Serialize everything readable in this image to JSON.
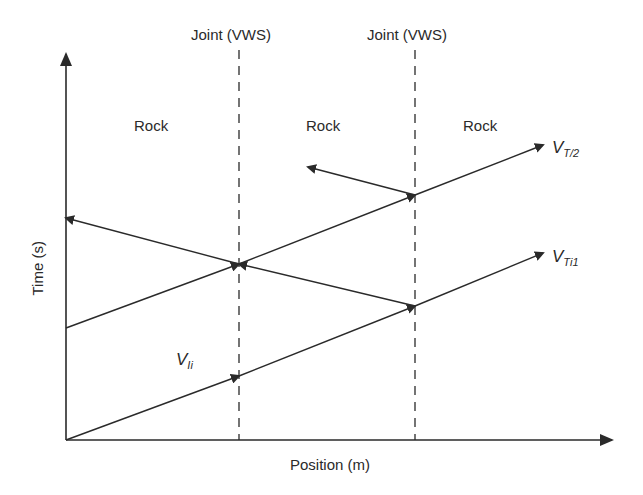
{
  "diagram": {
    "type": "wave-propagation-time-position",
    "axes": {
      "x_label": "Position (m)",
      "y_label": "Time (s)"
    },
    "joints": [
      {
        "label": "Joint (VWS)",
        "x": 239
      },
      {
        "label": "Joint (VWS)",
        "x": 415
      }
    ],
    "regions": [
      {
        "label": "Rock"
      },
      {
        "label": "Rock"
      },
      {
        "label": "Rock"
      }
    ],
    "wave_labels": {
      "incident": {
        "main": "V",
        "sub": "Ii"
      },
      "transmitted_1": {
        "main": "V",
        "sub": "Ti1"
      },
      "transmitted_2": {
        "main": "V",
        "sub": "T/2"
      }
    },
    "colors": {
      "line": "#2a2a2a",
      "background": "#ffffff"
    }
  }
}
